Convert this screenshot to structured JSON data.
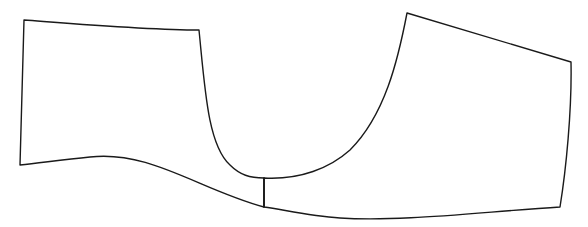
{
  "diagram": {
    "type": "sewing-pattern-outline",
    "background": "#ffffff",
    "stroke_color": "#1a1a1a",
    "pieces": [
      {
        "name": "left-panel",
        "path": "M24,20 C90,25 150,30 199,30 C205,90 208,145 230,165 C240,175 250,178 264,178 L264,207 C200,190 150,150 90,157 C60,160 40,163 20,165 Z"
      },
      {
        "name": "right-panel",
        "path": "M407,13 L571,62 C572,110 566,170 560,207 C480,212 400,222 340,218 C310,216 285,210 264,207 L264,178 C300,180 330,168 350,150 C385,115 398,60 407,13 Z"
      }
    ],
    "seam": {
      "name": "center-seam",
      "x1": 264,
      "y1": 178,
      "x2": 264,
      "y2": 207
    }
  }
}
